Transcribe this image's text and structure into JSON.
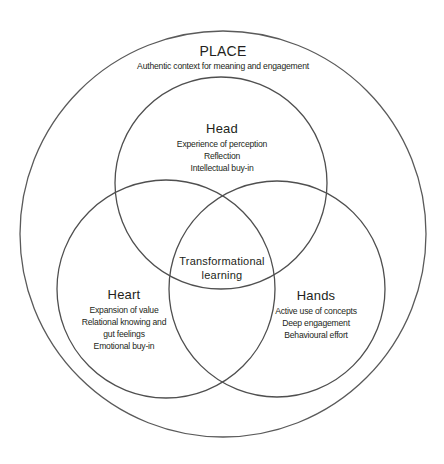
{
  "diagram": {
    "type": "venn",
    "stroke_color": "#555555",
    "outer": {
      "title": "PLACE",
      "subtitle": "Authentic context for meaning and engagement"
    },
    "circles": [
      {
        "id": "head",
        "title": "Head",
        "lines": [
          "Experience of perception",
          "Reflection",
          "Intellectual buy-in"
        ]
      },
      {
        "id": "heart",
        "title": "Heart",
        "lines": [
          "Expansion of value",
          "Relational knowing and",
          "gut feelings",
          "Emotional buy-in"
        ]
      },
      {
        "id": "hands",
        "title": "Hands",
        "lines": [
          "Active use of concepts",
          "Deep engagement",
          "Behavioural effort"
        ]
      }
    ],
    "center": {
      "line1": "Transformational",
      "line2": "learning"
    }
  }
}
